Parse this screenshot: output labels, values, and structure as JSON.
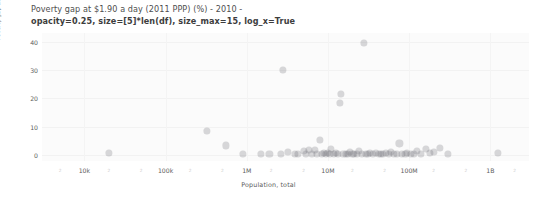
{
  "chart_data": {
    "type": "scatter",
    "title": "Poverty gap at $1.90 a day (2011 PPP) (%) - 2010 -",
    "subtitle": "opacity=0.25, size=[5]*len(df), size_max=15, log_x=True",
    "xlabel": "Population, total",
    "ylabel": "Poverty gap at $1.90 a day (2011 PPP) (%)",
    "xscale": "log",
    "yscale": "linear",
    "xlim": [
      3000,
      3000000000
    ],
    "ylim": [
      -2,
      43
    ],
    "grid": false,
    "legend": "none",
    "marker_color": "#68686e",
    "marker_opacity": 0.25,
    "marker_size_max": 15,
    "x_tick_labels": [
      "10k",
      "100k",
      "1M",
      "10M",
      "100M",
      "1B"
    ],
    "x_tick_values": [
      10000,
      100000,
      1000000,
      10000000,
      100000000,
      1000000000
    ],
    "x_minor_tick_label": "2",
    "y_tick_labels": [
      "0",
      "10",
      "20",
      "30",
      "40"
    ],
    "y_tick_values": [
      0,
      10,
      20,
      30,
      40
    ],
    "points": [
      {
        "x": 20000,
        "y": 1.0
      },
      {
        "x": 320000,
        "y": 8.6
      },
      {
        "x": 560000,
        "y": 3.5
      },
      {
        "x": 900000,
        "y": 0.5
      },
      {
        "x": 1500000,
        "y": 0.4
      },
      {
        "x": 1900000,
        "y": 0.5
      },
      {
        "x": 2800000,
        "y": 30.0
      },
      {
        "x": 2600000,
        "y": 0.6
      },
      {
        "x": 3200000,
        "y": 1.1
      },
      {
        "x": 3900000,
        "y": 0.4
      },
      {
        "x": 4300000,
        "y": 0.5
      },
      {
        "x": 5000000,
        "y": 1.4
      },
      {
        "x": 5400000,
        "y": 0.6
      },
      {
        "x": 5900000,
        "y": 2.0
      },
      {
        "x": 6400000,
        "y": 0.5
      },
      {
        "x": 6900000,
        "y": 1.8
      },
      {
        "x": 7400000,
        "y": 0.6
      },
      {
        "x": 8000000,
        "y": 5.5
      },
      {
        "x": 8400000,
        "y": 0.5
      },
      {
        "x": 9000000,
        "y": 1.0
      },
      {
        "x": 9500000,
        "y": 0.4
      },
      {
        "x": 10000000,
        "y": 0.8
      },
      {
        "x": 10500000,
        "y": 0.5
      },
      {
        "x": 11000000,
        "y": 2.1
      },
      {
        "x": 11800000,
        "y": 0.5
      },
      {
        "x": 12500000,
        "y": 1.0
      },
      {
        "x": 13200000,
        "y": 0.5
      },
      {
        "x": 14000000,
        "y": 18.5
      },
      {
        "x": 14500000,
        "y": 21.5
      },
      {
        "x": 15500000,
        "y": 0.6
      },
      {
        "x": 16500000,
        "y": 0.5
      },
      {
        "x": 17500000,
        "y": 0.4
      },
      {
        "x": 18500000,
        "y": 1.2
      },
      {
        "x": 20000000,
        "y": 0.5
      },
      {
        "x": 21000000,
        "y": 0.6
      },
      {
        "x": 22500000,
        "y": 0.5
      },
      {
        "x": 24000000,
        "y": 1.5
      },
      {
        "x": 26000000,
        "y": 0.5
      },
      {
        "x": 28000000,
        "y": 39.5
      },
      {
        "x": 29000000,
        "y": 0.6
      },
      {
        "x": 31000000,
        "y": 0.5
      },
      {
        "x": 33000000,
        "y": 0.9
      },
      {
        "x": 36000000,
        "y": 0.5
      },
      {
        "x": 39000000,
        "y": 1.0
      },
      {
        "x": 42000000,
        "y": 0.5
      },
      {
        "x": 45000000,
        "y": 0.6
      },
      {
        "x": 48000000,
        "y": 0.4
      },
      {
        "x": 52000000,
        "y": 0.8
      },
      {
        "x": 56000000,
        "y": 0.5
      },
      {
        "x": 60000000,
        "y": 1.2
      },
      {
        "x": 65000000,
        "y": 0.5
      },
      {
        "x": 70000000,
        "y": 0.6
      },
      {
        "x": 76000000,
        "y": 4.2
      },
      {
        "x": 82000000,
        "y": 0.5
      },
      {
        "x": 90000000,
        "y": 0.4
      },
      {
        "x": 95000000,
        "y": 1.0
      },
      {
        "x": 105000000,
        "y": 0.6
      },
      {
        "x": 115000000,
        "y": 0.5
      },
      {
        "x": 125000000,
        "y": 1.4
      },
      {
        "x": 140000000,
        "y": 0.5
      },
      {
        "x": 160000000,
        "y": 2.4
      },
      {
        "x": 180000000,
        "y": 0.7
      },
      {
        "x": 200000000,
        "y": 1.3
      },
      {
        "x": 240000000,
        "y": 2.6
      },
      {
        "x": 300000000,
        "y": 0.5
      },
      {
        "x": 1250000000,
        "y": 1.0
      }
    ]
  }
}
